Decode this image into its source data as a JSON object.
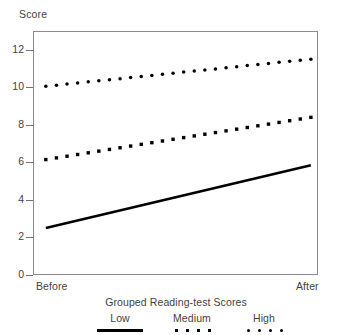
{
  "chart_data": {
    "type": "line",
    "title": "",
    "xlabel": "Grouped Reading-test Scores",
    "ylabel": "Score",
    "ylim": [
      0,
      13
    ],
    "yticks": [
      0,
      2,
      4,
      6,
      8,
      10,
      12
    ],
    "ytick_labels": [
      "0",
      "2",
      "4",
      "6",
      "8",
      "10",
      "12"
    ],
    "x": [
      "Before",
      "After"
    ],
    "xtick_labels": [
      "Before",
      "After"
    ],
    "grid": false,
    "legend_position": "bottom",
    "legend_title": "Grouped Reading-test Scores",
    "series": [
      {
        "name": "Low",
        "style": "solid-line",
        "marker": "none",
        "color": "#000000",
        "values": [
          2.5,
          5.85
        ],
        "n_points": 2
      },
      {
        "name": "Medium",
        "style": "dotted",
        "marker": "square",
        "color": "#000000",
        "values": [
          6.15,
          8.4
        ],
        "n_points": 26,
        "points": [
          6.15,
          6.24,
          6.33,
          6.42,
          6.51,
          6.6,
          6.69,
          6.78,
          6.87,
          6.96,
          7.05,
          7.14,
          7.23,
          7.32,
          7.41,
          7.5,
          7.59,
          7.68,
          7.77,
          7.86,
          7.95,
          8.04,
          8.13,
          8.22,
          8.31,
          8.4
        ]
      },
      {
        "name": "High",
        "style": "dotted",
        "marker": "circle",
        "color": "#000000",
        "values": [
          10.05,
          11.5
        ],
        "n_points": 26,
        "points": [
          10.05,
          10.11,
          10.17,
          10.23,
          10.29,
          10.35,
          10.4,
          10.46,
          10.52,
          10.58,
          10.63,
          10.69,
          10.75,
          10.81,
          10.87,
          10.92,
          10.98,
          11.04,
          11.1,
          11.16,
          11.21,
          11.27,
          11.33,
          11.39,
          11.44,
          11.5
        ]
      }
    ]
  },
  "axes": {
    "y_title": "Score",
    "x_before": "Before",
    "x_after": "After"
  },
  "legend": {
    "title": "Grouped Reading-test Scores",
    "entries": [
      {
        "label": "Low",
        "swatch": "solid-line-swatch"
      },
      {
        "label": "Medium",
        "swatch": "square-dots-swatch"
      },
      {
        "label": "High",
        "swatch": "round-dots-swatch"
      }
    ]
  }
}
